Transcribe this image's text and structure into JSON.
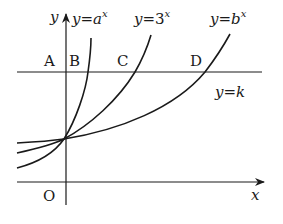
{
  "diagram": {
    "type": "exponential-functions-graph",
    "axes": {
      "x_label": "x",
      "y_label": "y",
      "origin_label": "O"
    },
    "curves": [
      {
        "id": "a",
        "label_prefix": "y=",
        "base": "a",
        "exponent": "x"
      },
      {
        "id": "3",
        "label_prefix": "y=",
        "base": "3",
        "exponent": "x"
      },
      {
        "id": "b",
        "label_prefix": "y=",
        "base": "b",
        "exponent": "x"
      }
    ],
    "horizontal_line": {
      "label": "y=k"
    },
    "points": [
      "A",
      "B",
      "C",
      "D"
    ],
    "colors": {
      "stroke": "#1a1a1a",
      "background": "#ffffff"
    }
  }
}
